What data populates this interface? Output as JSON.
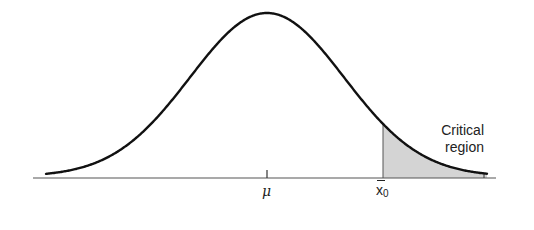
{
  "figure": {
    "annotation": {
      "line1": "Critical",
      "line2": "region"
    },
    "ticks": {
      "mean_label": "μ",
      "critical_label_base": "x",
      "critical_label_sub": "0"
    }
  },
  "colors": {
    "curve": "#111111",
    "axis": "#555555",
    "shade": "#d4d4d4"
  },
  "chart_data": {
    "type": "area",
    "title": "",
    "distribution": "normal",
    "xlabel": "",
    "ylabel": "",
    "tick_labels": [
      "μ",
      "x̄0"
    ],
    "annotations": [
      "Critical region"
    ],
    "shaded_region": {
      "from": "x̄0",
      "to": "+∞",
      "side": "right"
    },
    "grid": false,
    "legend": null
  }
}
